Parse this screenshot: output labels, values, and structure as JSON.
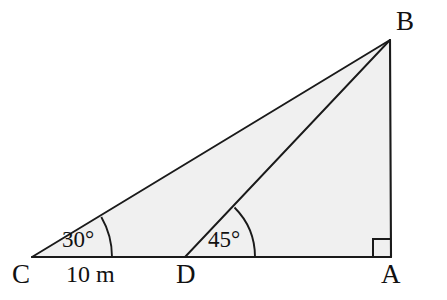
{
  "diagram": {
    "type": "geometry-figure",
    "background_color": "#ffffff",
    "fill_color": "#f0f0f0",
    "stroke_color": "#1a1a1a",
    "vertices": [
      {
        "name": "A",
        "label": "A",
        "x": 391,
        "y": 257
      },
      {
        "name": "B",
        "label": "B",
        "x": 390,
        "y": 40
      },
      {
        "name": "C",
        "label": "C",
        "x": 32,
        "y": 257
      },
      {
        "name": "D",
        "label": "D",
        "x": 185,
        "y": 257
      }
    ],
    "segments": [
      {
        "name": "segment-CA",
        "from": "C",
        "to": "A"
      },
      {
        "name": "segment-CB",
        "from": "C",
        "to": "B"
      },
      {
        "name": "segment-DB",
        "from": "D",
        "to": "B"
      },
      {
        "name": "segment-AB",
        "from": "A",
        "to": "B"
      }
    ],
    "angles": [
      {
        "name": "angle-at-C",
        "at": "C",
        "label": "30°",
        "value": 30,
        "unit": "degrees",
        "arc_radius": 80
      },
      {
        "name": "angle-at-D",
        "at": "D",
        "label": "45°",
        "value": 45,
        "unit": "degrees",
        "arc_radius": 70
      },
      {
        "name": "right-angle-at-A",
        "at": "A",
        "label": "",
        "value": 90,
        "unit": "degrees",
        "marker": "square"
      }
    ],
    "measurements": [
      {
        "name": "length-CD",
        "label": "10 m",
        "value": 10,
        "unit": "m",
        "between": [
          "C",
          "D"
        ]
      }
    ]
  }
}
